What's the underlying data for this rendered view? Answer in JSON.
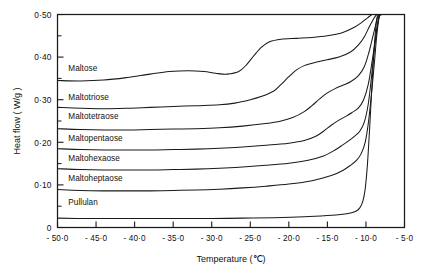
{
  "chart_data": {
    "type": "line",
    "title": "",
    "xlabel": "Temperature  (℃)",
    "ylabel": "Heat flow  ( W/g )",
    "xlim": [
      -50.0,
      -5.0
    ],
    "ylim": [
      0.0,
      0.5
    ],
    "grid": false,
    "legend_position": "inline-left-of-curve",
    "x_ticks": [
      "- 50·0",
      "- 45·0",
      "- 40·0",
      "- 35·0",
      "- 30·0",
      "- 25·0",
      "- 20·0",
      "- 15·0",
      "- 10·0",
      "- 5·0"
    ],
    "x_tick_values": [
      -50.0,
      -45.0,
      -40.0,
      -35.0,
      -30.0,
      -25.0,
      -20.0,
      -15.0,
      -10.0,
      -5.0
    ],
    "y_ticks": [
      "0",
      "0·10",
      "0·20",
      "0·30",
      "0·40",
      "0·50"
    ],
    "y_tick_values": [
      0.0,
      0.1,
      0.2,
      0.3,
      0.4,
      0.5
    ],
    "y_minor_tick_values": [
      0.05,
      0.15,
      0.25,
      0.35,
      0.45
    ],
    "series": [
      {
        "name": "Maltose",
        "label": "Maltose",
        "label_x": -48.6,
        "label_y": 0.368,
        "x": [
          -50.0,
          -47.0,
          -44.0,
          -41.0,
          -38.0,
          -35.5,
          -33.0,
          -31.0,
          -29.5,
          -28.0,
          -26.5,
          -25.5,
          -24.5,
          -23.5,
          -22.5,
          -21.0,
          -19.0,
          -17.0,
          -15.0,
          -13.0,
          -11.5,
          -10.5,
          -9.8,
          -9.2,
          -8.8,
          -8.4
        ],
        "y": [
          0.345,
          0.344,
          0.346,
          0.352,
          0.36,
          0.366,
          0.368,
          0.366,
          0.362,
          0.36,
          0.366,
          0.382,
          0.404,
          0.424,
          0.436,
          0.442,
          0.444,
          0.446,
          0.45,
          0.458,
          0.47,
          0.482,
          0.492,
          0.5,
          0.5,
          0.5
        ]
      },
      {
        "name": "Maltotriose",
        "label": "Maltotriose",
        "label_x": -48.6,
        "label_y": 0.3,
        "x": [
          -50.0,
          -47.0,
          -44.0,
          -41.0,
          -38.0,
          -35.0,
          -32.0,
          -29.0,
          -27.0,
          -25.0,
          -23.5,
          -22.0,
          -21.0,
          -20.0,
          -19.0,
          -18.0,
          -16.5,
          -15.0,
          -13.5,
          -12.0,
          -11.0,
          -10.2,
          -9.6,
          -9.0,
          -8.6,
          -8.2
        ],
        "y": [
          0.282,
          0.28,
          0.279,
          0.28,
          0.282,
          0.284,
          0.286,
          0.288,
          0.292,
          0.3,
          0.308,
          0.32,
          0.336,
          0.354,
          0.37,
          0.38,
          0.388,
          0.394,
          0.4,
          0.412,
          0.428,
          0.448,
          0.47,
          0.49,
          0.5,
          0.5
        ]
      },
      {
        "name": "Maltotetraose",
        "label": "Maltotetraose",
        "label_x": -48.6,
        "label_y": 0.254,
        "x": [
          -50.0,
          -47.0,
          -44.0,
          -41.0,
          -38.0,
          -35.0,
          -32.0,
          -29.0,
          -26.0,
          -23.0,
          -21.0,
          -19.5,
          -18.0,
          -17.0,
          -16.0,
          -15.0,
          -14.0,
          -13.0,
          -12.0,
          -11.0,
          -10.2,
          -9.6,
          -9.0,
          -8.5,
          -8.1
        ],
        "y": [
          0.232,
          0.23,
          0.229,
          0.229,
          0.23,
          0.231,
          0.232,
          0.234,
          0.238,
          0.244,
          0.25,
          0.258,
          0.272,
          0.286,
          0.302,
          0.316,
          0.326,
          0.334,
          0.342,
          0.356,
          0.378,
          0.412,
          0.456,
          0.492,
          0.5
        ]
      },
      {
        "name": "Maltopentaose",
        "label": "Maltopentaose",
        "label_x": -48.6,
        "label_y": 0.204,
        "x": [
          -50.0,
          -47.0,
          -44.0,
          -41.0,
          -38.0,
          -35.0,
          -32.0,
          -29.0,
          -26.0,
          -23.0,
          -20.0,
          -18.0,
          -16.5,
          -15.5,
          -14.5,
          -13.5,
          -12.5,
          -11.8,
          -11.0,
          -10.3,
          -9.7,
          -9.2,
          -8.7,
          -8.3,
          -8.0
        ],
        "y": [
          0.185,
          0.183,
          0.182,
          0.182,
          0.182,
          0.183,
          0.184,
          0.186,
          0.189,
          0.193,
          0.198,
          0.204,
          0.214,
          0.226,
          0.24,
          0.252,
          0.262,
          0.27,
          0.28,
          0.3,
          0.336,
          0.39,
          0.45,
          0.496,
          0.5
        ]
      },
      {
        "name": "Maltohexaose",
        "label": "Maltohexaose",
        "label_x": -48.6,
        "label_y": 0.156,
        "x": [
          -50.0,
          -47.0,
          -44.0,
          -41.0,
          -38.0,
          -35.0,
          -32.0,
          -29.0,
          -26.0,
          -23.0,
          -20.0,
          -17.5,
          -15.5,
          -14.0,
          -13.0,
          -12.2,
          -11.5,
          -10.8,
          -10.2,
          -9.7,
          -9.3,
          -8.9,
          -8.5,
          -8.2,
          -7.9
        ],
        "y": [
          0.138,
          0.136,
          0.135,
          0.135,
          0.135,
          0.136,
          0.137,
          0.139,
          0.142,
          0.146,
          0.151,
          0.158,
          0.168,
          0.182,
          0.194,
          0.204,
          0.214,
          0.226,
          0.248,
          0.29,
          0.35,
          0.42,
          0.478,
          0.5,
          0.5
        ]
      },
      {
        "name": "Maltoheptaose",
        "label": "Maltoheptaose",
        "label_x": -48.6,
        "label_y": 0.11,
        "x": [
          -50.0,
          -47.0,
          -44.0,
          -41.0,
          -38.0,
          -35.0,
          -32.0,
          -29.0,
          -26.0,
          -23.0,
          -20.0,
          -17.0,
          -14.5,
          -13.0,
          -12.0,
          -11.2,
          -10.6,
          -10.1,
          -9.7,
          -9.3,
          -8.9,
          -8.6,
          -8.3,
          -8.0,
          -7.8
        ],
        "y": [
          0.089,
          0.087,
          0.086,
          0.086,
          0.086,
          0.087,
          0.088,
          0.09,
          0.093,
          0.097,
          0.102,
          0.11,
          0.122,
          0.134,
          0.146,
          0.158,
          0.174,
          0.2,
          0.244,
          0.31,
          0.388,
          0.45,
          0.492,
          0.5,
          0.5
        ]
      },
      {
        "name": "Pullulan",
        "label": "Pullulan",
        "label_x": -48.6,
        "label_y": 0.052,
        "x": [
          -50.0,
          -46.0,
          -42.0,
          -38.0,
          -34.0,
          -30.0,
          -26.0,
          -22.0,
          -18.0,
          -15.0,
          -13.0,
          -12.0,
          -11.3,
          -10.8,
          -10.4,
          -10.1,
          -9.8,
          -9.5,
          -9.2,
          -8.9,
          -8.6,
          -8.3
        ],
        "y": [
          0.022,
          0.021,
          0.021,
          0.021,
          0.021,
          0.021,
          0.022,
          0.023,
          0.025,
          0.028,
          0.031,
          0.034,
          0.038,
          0.046,
          0.062,
          0.09,
          0.15,
          0.24,
          0.34,
          0.43,
          0.49,
          0.5
        ]
      }
    ]
  },
  "colors": {
    "ink": "#1a1a1a",
    "background": "#ffffff"
  }
}
